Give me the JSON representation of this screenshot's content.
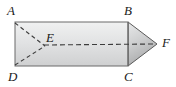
{
  "figure": {
    "type": "geometry-diagram",
    "background_color": "#ffffff",
    "outline_color": "#4a4a4a",
    "dash_color": "#3c3c3c",
    "fill_light": "#eceded",
    "fill_mid": "#d9dadb",
    "fill_dark": "#b9babb",
    "vertices": [
      {
        "id": "A",
        "label": "A",
        "x": 15,
        "y": 22,
        "label_x": 7,
        "label_y": 4
      },
      {
        "id": "B",
        "label": "B",
        "x": 128,
        "y": 22,
        "label_x": 124,
        "label_y": 4
      },
      {
        "id": "C",
        "label": "C",
        "x": 128,
        "y": 66,
        "label_x": 124,
        "label_y": 70
      },
      {
        "id": "D",
        "label": "D",
        "x": 15,
        "y": 66,
        "label_x": 8,
        "label_y": 70
      },
      {
        "id": "E",
        "label": "E",
        "x": 44,
        "y": 45,
        "label_x": 46,
        "label_y": 31
      },
      {
        "id": "F",
        "label": "F",
        "x": 157,
        "y": 44,
        "label_x": 162,
        "label_y": 36
      }
    ],
    "solid_edges": [
      {
        "name": "edge-AB",
        "from": "A",
        "to": "B"
      },
      {
        "name": "edge-BC",
        "from": "B",
        "to": "C"
      },
      {
        "name": "edge-CD",
        "from": "C",
        "to": "D"
      },
      {
        "name": "edge-DA",
        "from": "D",
        "to": "A"
      },
      {
        "name": "edge-BF",
        "from": "B",
        "to": "F"
      },
      {
        "name": "edge-CF",
        "from": "C",
        "to": "F"
      }
    ],
    "dashed_edges": [
      {
        "name": "edge-AE",
        "from": "A",
        "to": "E"
      },
      {
        "name": "edge-DE",
        "from": "D",
        "to": "E"
      },
      {
        "name": "edge-EF",
        "from": "E",
        "to": "F"
      }
    ]
  }
}
